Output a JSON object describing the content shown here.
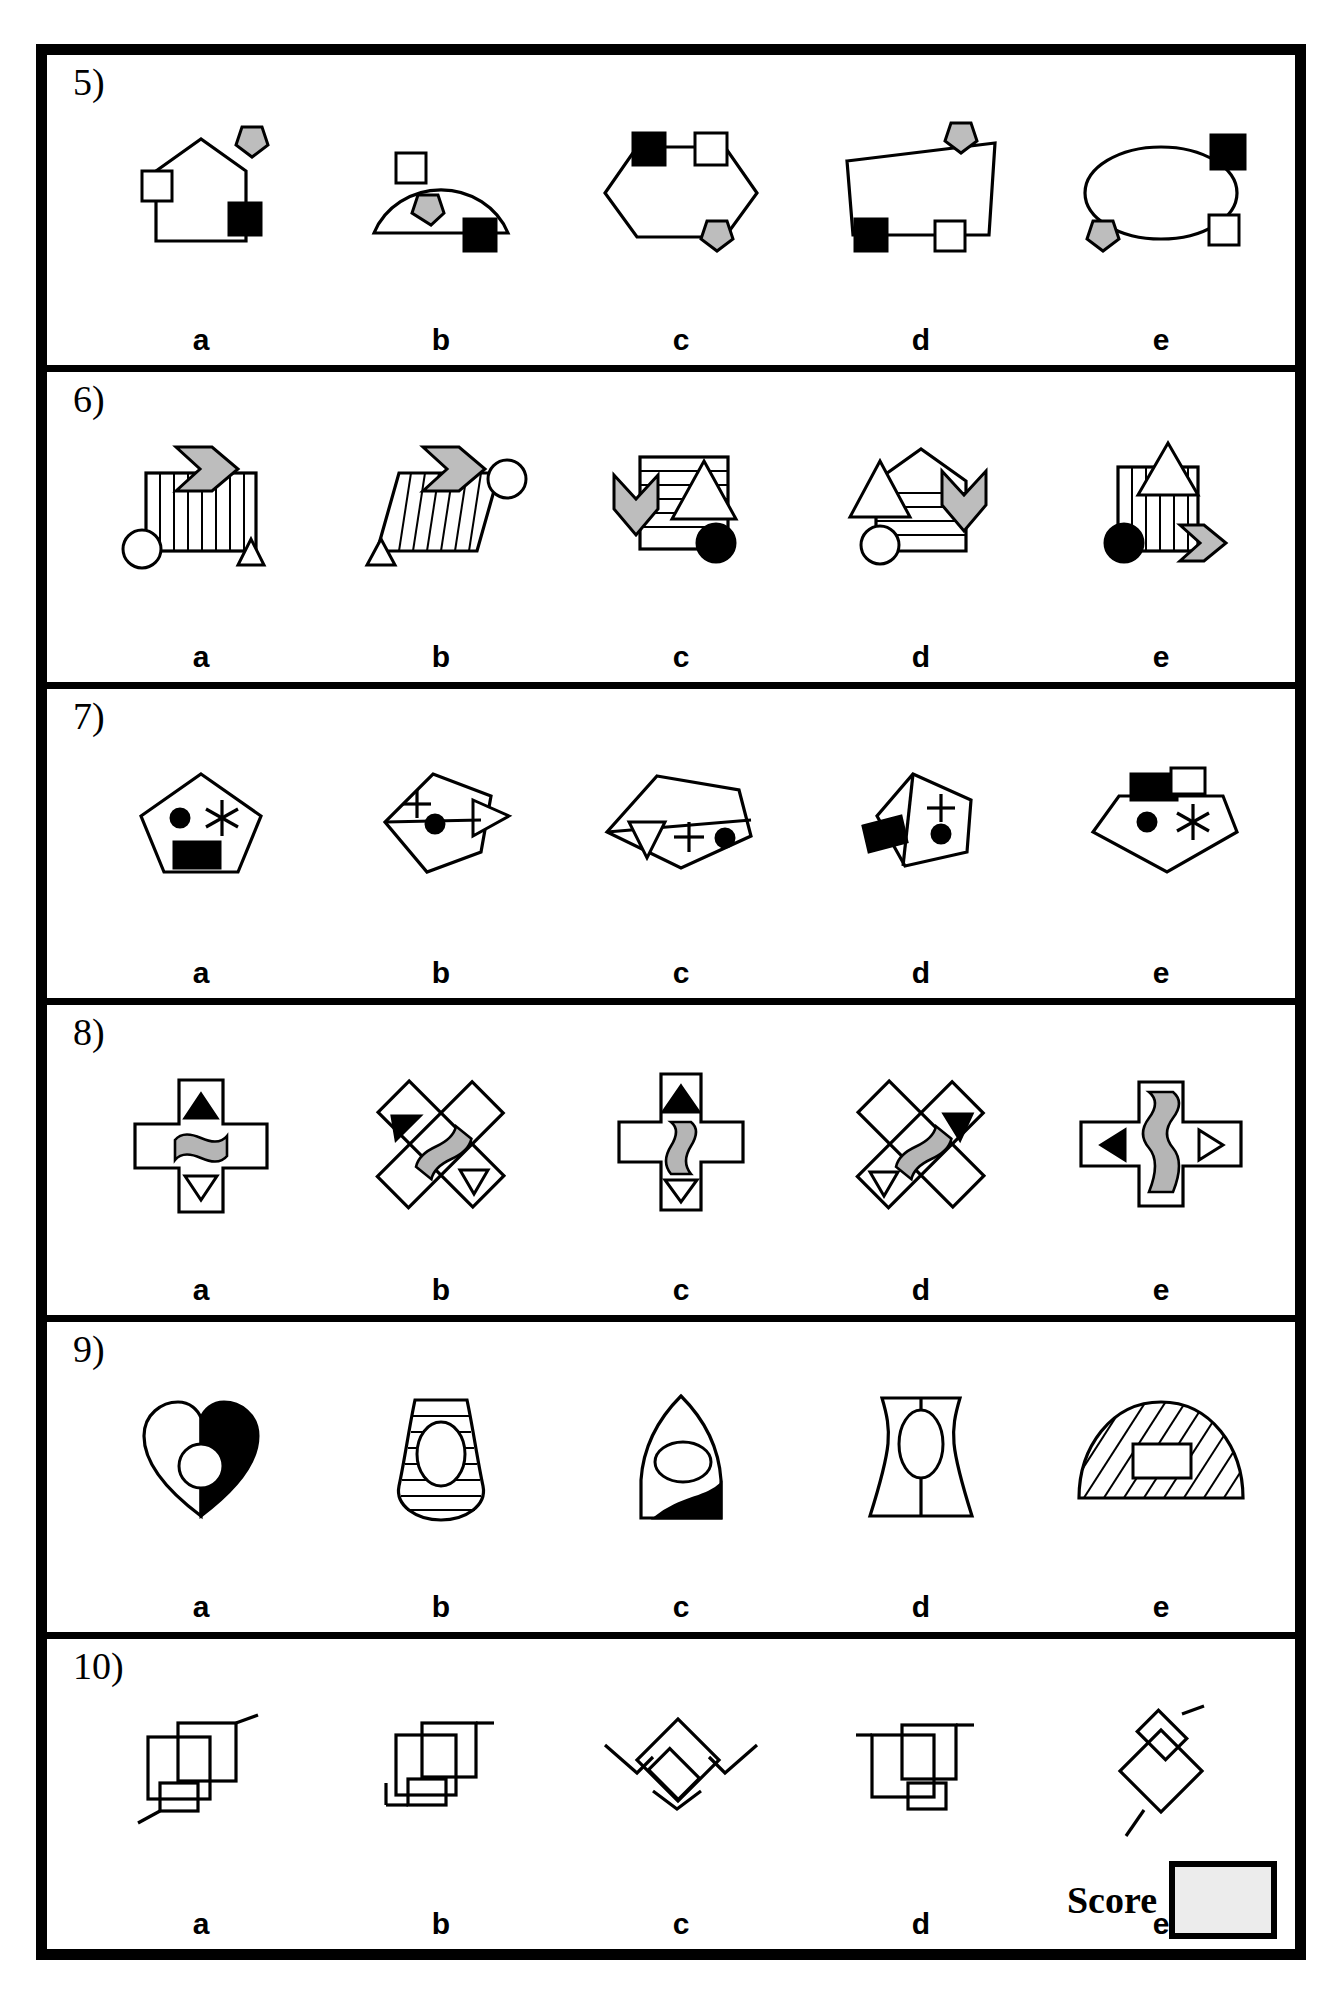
{
  "sheet": {
    "title": "Visual figure matching worksheet",
    "option_labels": [
      "a",
      "b",
      "c",
      "d",
      "e"
    ],
    "score": {
      "label": "Score",
      "value": ""
    }
  },
  "questions": [
    {
      "number": "5)",
      "options": [
        {
          "label": "a",
          "figure": "house-pentagon-outline",
          "markers": [
            "white-square-left",
            "black-square-lower-right",
            "gray-pentagon-top"
          ]
        },
        {
          "label": "b",
          "figure": "semicircle-dome",
          "markers": [
            "white-square-upper-left",
            "gray-pentagon-inside",
            "black-square-bottom-right"
          ]
        },
        {
          "label": "c",
          "figure": "hexagon",
          "markers": [
            "black-square-top-left",
            "white-square-top-right",
            "gray-pentagon-bottom"
          ]
        },
        {
          "label": "d",
          "figure": "trapezoid",
          "markers": [
            "gray-pentagon-top",
            "black-square-bottom-left",
            "white-square-bottom-right"
          ]
        },
        {
          "label": "e",
          "figure": "ellipse",
          "markers": [
            "black-square-top-right",
            "white-square-bottom-right",
            "gray-pentagon-bottom-left"
          ]
        }
      ]
    },
    {
      "number": "6)",
      "options": [
        {
          "label": "a",
          "figure": "rectangle-vertical-hatch",
          "markers": [
            "gray-chevron-arrow-right",
            "white-circle-bottom-left",
            "white-triangle-bottom-right"
          ]
        },
        {
          "label": "b",
          "figure": "parallelogram-vertical-hatch",
          "markers": [
            "gray-chevron-arrow-right",
            "white-circle-right",
            "white-triangle-bottom-left"
          ]
        },
        {
          "label": "c",
          "figure": "square-horizontal-hatch",
          "markers": [
            "gray-chevron-arrow-down",
            "white-triangle-right",
            "black-circle-bottom-right"
          ]
        },
        {
          "label": "d",
          "figure": "pentagon-house-horizontal-hatch",
          "markers": [
            "gray-chevron-arrow-down-right",
            "white-triangle-left",
            "white-circle-bottom-left"
          ]
        },
        {
          "label": "e",
          "figure": "rectangle-vertical-hatch",
          "markers": [
            "white-triangle-top",
            "black-circle-bottom-left",
            "gray-chevron-arrow-right"
          ]
        }
      ]
    },
    {
      "number": "7)",
      "options": [
        {
          "label": "a",
          "figure": "pentagon",
          "markers": [
            "black-dot",
            "asterisk",
            "black-rectangle-bottom"
          ]
        },
        {
          "label": "b",
          "figure": "pentagon-rotated",
          "markers": [
            "plus-sign",
            "black-dot",
            "white-triangle-right"
          ]
        },
        {
          "label": "c",
          "figure": "pentagon-wide",
          "markers": [
            "white-triangle-left",
            "plus-sign",
            "black-dot"
          ]
        },
        {
          "label": "d",
          "figure": "pentagon-tilted",
          "markers": [
            "plus-sign",
            "black-dot",
            "black-rectangle-left"
          ]
        },
        {
          "label": "e",
          "figure": "pentagon-wide",
          "markers": [
            "black-rectangle-top",
            "black-dot",
            "asterisk"
          ]
        }
      ]
    },
    {
      "number": "8)",
      "options": [
        {
          "label": "a",
          "figure": "cross-plus",
          "markers": [
            "black-triangle-up",
            "gray-bone",
            "white-triangle-down"
          ]
        },
        {
          "label": "b",
          "figure": "cross-diagonal",
          "markers": [
            "black-triangle-up-left",
            "gray-bone-diagonal",
            "white-triangle-down-right"
          ]
        },
        {
          "label": "c",
          "figure": "cross-tall",
          "markers": [
            "black-triangle-up",
            "gray-bone-vertical",
            "white-triangle-down"
          ]
        },
        {
          "label": "d",
          "figure": "cross-diagonal",
          "markers": [
            "gray-bone-diagonal",
            "black-triangle-up-right",
            "white-triangle-down-left"
          ]
        },
        {
          "label": "e",
          "figure": "cross-wide",
          "markers": [
            "black-triangle-left",
            "gray-bone-vertical",
            "white-triangle-right"
          ]
        }
      ]
    },
    {
      "number": "9)",
      "options": [
        {
          "label": "a",
          "figure": "heart-half-black",
          "markers": [
            "white-circle-center"
          ]
        },
        {
          "label": "b",
          "figure": "lantern-horizontal-hatch",
          "markers": [
            "white-ellipse-center"
          ]
        },
        {
          "label": "c",
          "figure": "arch-shape",
          "markers": [
            "white-ellipse-center",
            "black-wedge-bottom"
          ]
        },
        {
          "label": "d",
          "figure": "hourglass-concave",
          "markers": [
            "white-ellipse-center",
            "vertical-line"
          ]
        },
        {
          "label": "e",
          "figure": "fan-sector-diagonal-hatch",
          "markers": [
            "white-rectangle-center"
          ]
        }
      ]
    },
    {
      "number": "10)",
      "options": [
        {
          "label": "a",
          "figure": "overlapping-squares-with-tails",
          "markers": []
        },
        {
          "label": "b",
          "figure": "overlapping-squares-stepped",
          "markers": []
        },
        {
          "label": "c",
          "figure": "overlapping-diamonds-zigzag",
          "markers": []
        },
        {
          "label": "d",
          "figure": "overlapping-squares-variant",
          "markers": []
        },
        {
          "label": "e",
          "figure": "overlapping-diamonds-vertical",
          "markers": []
        }
      ]
    }
  ]
}
